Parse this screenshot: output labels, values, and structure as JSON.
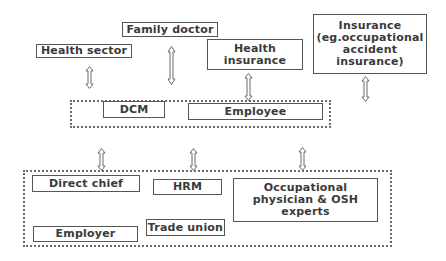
{
  "diagram": {
    "type": "stakeholder-relationship-diagram",
    "external_nodes": [
      {
        "id": "health-sector",
        "label": "Health sector"
      },
      {
        "id": "family-doctor",
        "label": "Family doctor"
      },
      {
        "id": "health-insurance",
        "label": "Health\ninsurance"
      },
      {
        "id": "insurance",
        "label": "Insurance\n(eg.occupational\naccident\ninsurance)"
      }
    ],
    "middle_group": {
      "nodes": [
        {
          "id": "dcm",
          "label": "DCM"
        },
        {
          "id": "employee",
          "label": "Employee"
        }
      ]
    },
    "bottom_group": {
      "nodes": [
        {
          "id": "direct-chief",
          "label": "Direct chief"
        },
        {
          "id": "hrm",
          "label": "HRM"
        },
        {
          "id": "occupational-physician",
          "label": "Occupational\nphysician & OSH\nexperts"
        },
        {
          "id": "employer",
          "label": "Employer"
        },
        {
          "id": "trade-union",
          "label": "Trade union"
        }
      ]
    },
    "edges": [
      {
        "from": "health-sector",
        "to": "middle_group",
        "style": "bidirectional"
      },
      {
        "from": "family-doctor",
        "to": "middle_group",
        "style": "bidirectional"
      },
      {
        "from": "health-insurance",
        "to": "middle_group",
        "style": "bidirectional"
      },
      {
        "from": "insurance",
        "to": "middle_group",
        "style": "bidirectional"
      },
      {
        "from": "middle_group",
        "to": "bottom_group",
        "style": "bidirectional",
        "count": 3
      }
    ],
    "colors": {
      "box_border": "#555555",
      "text": "#3a3a3a",
      "group_border": "#6a6a6a",
      "background": "#ffffff"
    }
  }
}
